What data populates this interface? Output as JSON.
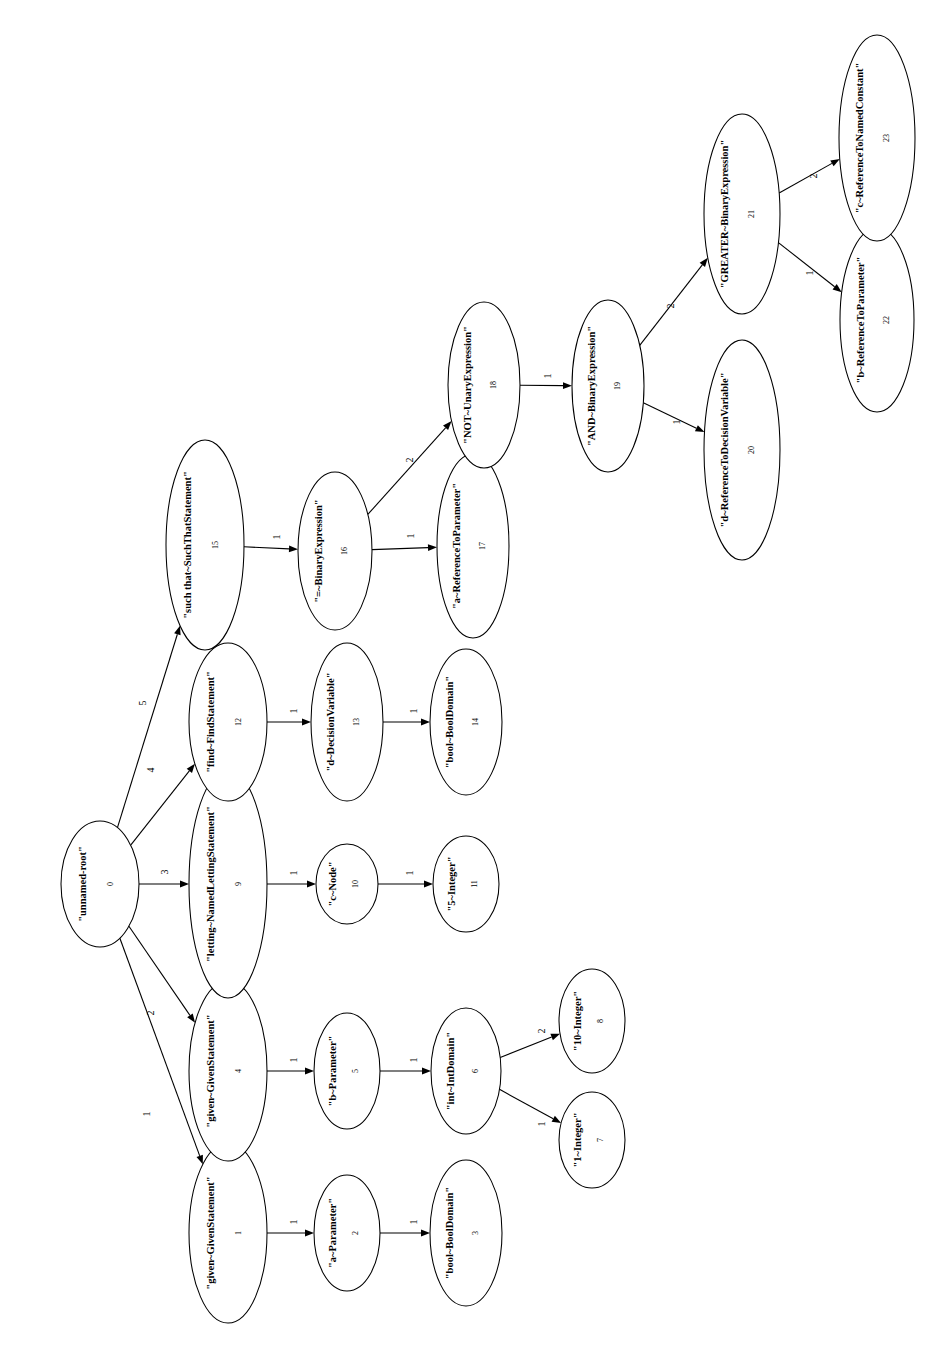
{
  "diagram": {
    "type": "tree",
    "orientation": "rotated-90-ccw",
    "canvas": {
      "width": 947,
      "height": 1369
    },
    "style": {
      "node_shape": "ellipse",
      "node_fill": "#ffffff",
      "node_stroke": "#000000",
      "edge_color": "#000000",
      "background": "#ffffff"
    },
    "nodes": [
      {
        "id": 0,
        "label": "\"unnamed-root\"",
        "index": "0",
        "cx": 100,
        "cy": 884,
        "rx": 39,
        "ry": 63,
        "fontsize": 10.5
      },
      {
        "id": 1,
        "label": "\"given~GivenStatement\"",
        "index": "1",
        "cx": 228,
        "cy": 1233,
        "rx": 39,
        "ry": 90,
        "fontsize": 10.5
      },
      {
        "id": 2,
        "label": "\"a~Parameter\"",
        "index": "2",
        "cx": 347,
        "cy": 1233,
        "rx": 33,
        "ry": 58,
        "fontsize": 10.5
      },
      {
        "id": 3,
        "label": "\"bool~BoolDomain\"",
        "index": "3",
        "cx": 466,
        "cy": 1233,
        "rx": 36,
        "ry": 73,
        "fontsize": 10.5
      },
      {
        "id": 4,
        "label": "\"given~GivenStatement\"",
        "index": "4",
        "cx": 228,
        "cy": 1071,
        "rx": 39,
        "ry": 90,
        "fontsize": 10.5
      },
      {
        "id": 5,
        "label": "\"b~Parameter\"",
        "index": "5",
        "cx": 347,
        "cy": 1071,
        "rx": 33,
        "ry": 58,
        "fontsize": 10.5
      },
      {
        "id": 6,
        "label": "\"int~IntDomain\"",
        "index": "6",
        "cx": 466,
        "cy": 1071,
        "rx": 35,
        "ry": 63,
        "fontsize": 10.5
      },
      {
        "id": 7,
        "label": "\"1~Integer\"",
        "index": "7",
        "cx": 592,
        "cy": 1140,
        "rx": 33,
        "ry": 48,
        "fontsize": 10.5
      },
      {
        "id": 8,
        "label": "\"10~Integer\"",
        "index": "8",
        "cx": 592,
        "cy": 1021,
        "rx": 33,
        "ry": 52,
        "fontsize": 10.5
      },
      {
        "id": 9,
        "label": "\"letting~NamedLettingStatement\"",
        "index": "9",
        "cx": 228,
        "cy": 884,
        "rx": 39,
        "ry": 114,
        "fontsize": 10.5
      },
      {
        "id": 10,
        "label": "\"c~Node\"",
        "index": "10",
        "cx": 347,
        "cy": 884,
        "rx": 31,
        "ry": 40,
        "fontsize": 10.5
      },
      {
        "id": 11,
        "label": "\"5~Integer\"",
        "index": "11",
        "cx": 466,
        "cy": 884,
        "rx": 33,
        "ry": 48,
        "fontsize": 10.5
      },
      {
        "id": 12,
        "label": "\"find~FindStatement\"",
        "index": "12",
        "cx": 228,
        "cy": 722,
        "rx": 39,
        "ry": 79,
        "fontsize": 10.5
      },
      {
        "id": 13,
        "label": "\"d~DecisionVariable\"",
        "index": "13",
        "cx": 347,
        "cy": 722,
        "rx": 36,
        "ry": 79,
        "fontsize": 10.5
      },
      {
        "id": 14,
        "label": "\"bool~BoolDomain\"",
        "index": "14",
        "cx": 466,
        "cy": 722,
        "rx": 36,
        "ry": 73,
        "fontsize": 10.5
      },
      {
        "id": 15,
        "label": "\"such that~SuchThatStatement\"",
        "index": "15",
        "cx": 205,
        "cy": 545,
        "rx": 39,
        "ry": 105,
        "fontsize": 10.5
      },
      {
        "id": 16,
        "label": "\"=~BinaryExpression\"",
        "index": "16",
        "cx": 335,
        "cy": 551,
        "rx": 37,
        "ry": 79,
        "fontsize": 10.5
      },
      {
        "id": 17,
        "label": "\"a~ReferenceToParameter\"",
        "index": "17",
        "cx": 473,
        "cy": 546,
        "rx": 36,
        "ry": 92,
        "fontsize": 10.5
      },
      {
        "id": 18,
        "label": "\"NOT~UnaryExpression\"",
        "index": "18",
        "cx": 484,
        "cy": 385,
        "rx": 36,
        "ry": 83,
        "fontsize": 10.5
      },
      {
        "id": 19,
        "label": "\"AND~BinaryExpression\"",
        "index": "19",
        "cx": 608,
        "cy": 386,
        "rx": 36,
        "ry": 86,
        "fontsize": 10.5
      },
      {
        "id": 20,
        "label": "\"d~ReferenceToDecisionVariable\"",
        "index": "20",
        "cx": 742,
        "cy": 450,
        "rx": 38,
        "ry": 110,
        "fontsize": 10.5
      },
      {
        "id": 21,
        "label": "\"GREATER~BinaryExpression\"",
        "index": "21",
        "cx": 742,
        "cy": 214,
        "rx": 38,
        "ry": 100,
        "fontsize": 10.5
      },
      {
        "id": 22,
        "label": "\"b~ReferenceToParameter\"",
        "index": "22",
        "cx": 877,
        "cy": 320,
        "rx": 37,
        "ry": 92,
        "fontsize": 10.5
      },
      {
        "id": 23,
        "label": "\"c~ReferenceToNamedConstant\"",
        "index": "23",
        "cx": 877,
        "cy": 138,
        "rx": 38,
        "ry": 103,
        "fontsize": 10.5
      }
    ],
    "edges": [
      {
        "from": 0,
        "to": 1,
        "label": "1",
        "lx": 148,
        "ly": 1114
      },
      {
        "from": 0,
        "to": 4,
        "label": "2",
        "lx": 152,
        "ly": 1013
      },
      {
        "from": 0,
        "to": 9,
        "label": "3",
        "lx": 166,
        "ly": 872
      },
      {
        "from": 0,
        "to": 12,
        "label": "4",
        "lx": 152,
        "ly": 770
      },
      {
        "from": 0,
        "to": 15,
        "label": "5",
        "lx": 144,
        "ly": 703
      },
      {
        "from": 1,
        "to": 2,
        "label": "1",
        "lx": 295,
        "ly": 1222
      },
      {
        "from": 2,
        "to": 3,
        "label": "1",
        "lx": 415,
        "ly": 1222
      },
      {
        "from": 4,
        "to": 5,
        "label": "1",
        "lx": 295,
        "ly": 1060
      },
      {
        "from": 5,
        "to": 6,
        "label": "1",
        "lx": 415,
        "ly": 1060
      },
      {
        "from": 6,
        "to": 7,
        "label": "1",
        "lx": 543,
        "ly": 1124
      },
      {
        "from": 6,
        "to": 8,
        "label": "2",
        "lx": 543,
        "ly": 1031
      },
      {
        "from": 9,
        "to": 10,
        "label": "1",
        "lx": 295,
        "ly": 873
      },
      {
        "from": 10,
        "to": 11,
        "label": "1",
        "lx": 411,
        "ly": 873
      },
      {
        "from": 12,
        "to": 13,
        "label": "1",
        "lx": 295,
        "ly": 711
      },
      {
        "from": 13,
        "to": 14,
        "label": "1",
        "lx": 415,
        "ly": 711
      },
      {
        "from": 15,
        "to": 16,
        "label": "1",
        "lx": 278,
        "ly": 537
      },
      {
        "from": 16,
        "to": 17,
        "label": "1",
        "lx": 412,
        "ly": 536
      },
      {
        "from": 16,
        "to": 18,
        "label": "2",
        "lx": 411,
        "ly": 460
      },
      {
        "from": 18,
        "to": 19,
        "label": "1",
        "lx": 549,
        "ly": 376
      },
      {
        "from": 19,
        "to": 20,
        "label": "1",
        "lx": 678,
        "ly": 422
      },
      {
        "from": 19,
        "to": 21,
        "label": "2",
        "lx": 672,
        "ly": 306
      },
      {
        "from": 21,
        "to": 22,
        "label": "1",
        "lx": 811,
        "ly": 273
      },
      {
        "from": 21,
        "to": 23,
        "label": "2",
        "lx": 815,
        "ly": 176
      }
    ]
  }
}
